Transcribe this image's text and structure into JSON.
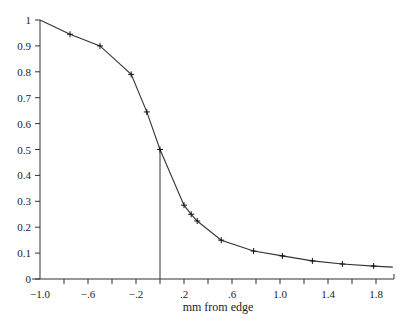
{
  "chart_data": {
    "type": "line",
    "title": "",
    "xlabel": "mm from edge",
    "ylabel": "",
    "xlim": [
      -1.0,
      1.95
    ],
    "ylim": [
      0,
      1.0
    ],
    "grid": false,
    "legend": null,
    "x_ticks": [
      -1.0,
      -0.8,
      -0.6,
      -0.4,
      -0.2,
      0.0,
      0.2,
      0.4,
      0.6,
      0.8,
      1.0,
      1.2,
      1.4,
      1.6,
      1.8
    ],
    "x_tick_labels": [
      "-1.0",
      "",
      "-.6",
      "",
      "-.2",
      "",
      ".2",
      "",
      ".6",
      "",
      "1.0",
      "",
      "1.4",
      "",
      "1.8"
    ],
    "y_ticks": [
      0,
      0.1,
      0.2,
      0.3,
      0.4,
      0.5,
      0.6,
      0.7,
      0.8,
      0.9,
      1.0
    ],
    "y_tick_labels": [
      "0",
      "0.1",
      "0.2",
      "0.3",
      "0.4",
      "0.5",
      "0.6",
      "0.7",
      "0.8",
      "0.9",
      "1"
    ],
    "series": [
      {
        "name": "profile",
        "marker": "+",
        "x": [
          -1.0,
          -0.75,
          -0.5,
          -0.24,
          -0.11,
          0.0,
          0.2,
          0.26,
          0.31,
          0.51,
          0.78,
          1.02,
          1.27,
          1.52,
          1.78,
          1.94
        ],
        "y": [
          1.0,
          0.945,
          0.9,
          0.79,
          0.645,
          0.5,
          0.285,
          0.25,
          0.224,
          0.15,
          0.108,
          0.089,
          0.07,
          0.058,
          0.05,
          0.046
        ],
        "marker_mask": [
          false,
          true,
          true,
          true,
          true,
          true,
          true,
          true,
          true,
          true,
          true,
          true,
          true,
          true,
          true,
          false
        ]
      }
    ],
    "annotations": [
      {
        "type": "vertical-line",
        "x": 0.0,
        "y_from": 0,
        "y_to": 0.5
      }
    ]
  },
  "colors": {
    "line": "#333333",
    "axis": "#333333",
    "background": "#ffffff"
  }
}
